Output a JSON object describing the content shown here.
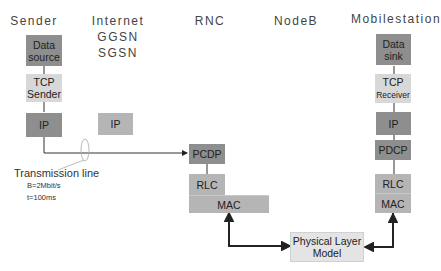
{
  "columns": {
    "sender": "Sender",
    "internet": "Internet",
    "ggsn": "GGSN",
    "sgsn": "SGSN",
    "rnc": "RNC",
    "nodeb": "NodeB",
    "mobilestation": "Mobilestation"
  },
  "sender_stack": {
    "data_source_line1": "Data",
    "data_source_line2": "source",
    "tcp_line1": "TCP",
    "tcp_line2": "Sender",
    "ip": "IP"
  },
  "internet_stack": {
    "ip": "IP"
  },
  "rnc_stack": {
    "pcdp": "PCDP",
    "rlc": "RLC",
    "mac": "MAC"
  },
  "mobile_stack": {
    "data_sink_line1": "Data",
    "data_sink_line2": "sink",
    "tcp_line1": "TCP",
    "tcp_line2": "Receiver",
    "ip": "IP",
    "pdcp": "PDCP",
    "rlc": "RLC",
    "mac": "MAC"
  },
  "physical_layer": {
    "line1": "Physical Layer",
    "line2": "Model"
  },
  "transmission_line": {
    "label": "Transmission line",
    "bandwidth": "B=2Mbit/s",
    "delay": "t=100ms"
  },
  "colors": {
    "dark_box": "#8e8e8e",
    "mid_box": "#b5b5b5",
    "light_box": "#d8d8d8",
    "line": "#222222"
  }
}
